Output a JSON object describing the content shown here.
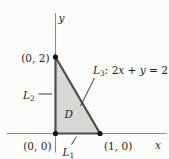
{
  "figure": {
    "type": "math-diagram",
    "description_visible_only": false,
    "axes": {
      "x_label": "x",
      "y_label": "y"
    },
    "points": {
      "y_intercept": "(0, 2)",
      "origin": "(0, 0)",
      "x_intercept": "(1, 0)"
    },
    "region": {
      "label": "D"
    },
    "lines": {
      "l1": {
        "base": "L",
        "sub": "1"
      },
      "l2": {
        "base": "L",
        "sub": "2"
      },
      "l3": {
        "base": "L",
        "sub": "3",
        "sep": ": ",
        "eq": {
          "c1": "2",
          "v1": "x",
          "op": " + ",
          "v2": "y",
          "rhs": " = 2"
        }
      }
    },
    "colors": {
      "region_fill": "#d8d7d4",
      "edge_stroke": "#4e4e4e",
      "axis_stroke": "#8c8c8c",
      "leader_stroke": "#3a3a3a",
      "point_fill": "#121212",
      "text": "#1c1c1c",
      "background": "#fcfcfa"
    }
  }
}
